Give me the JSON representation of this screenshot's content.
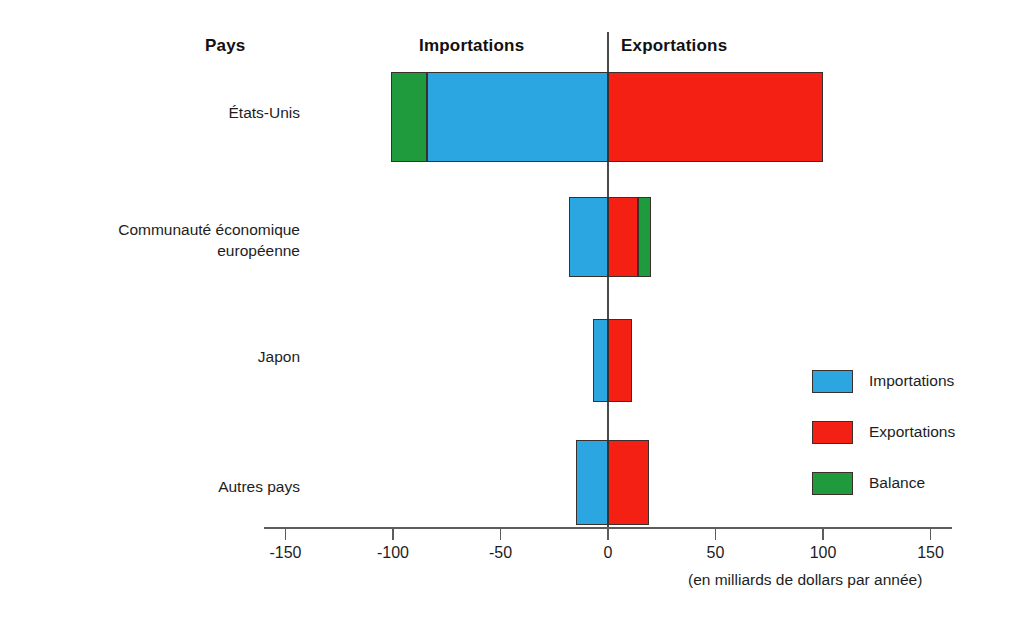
{
  "headers": {
    "category_col": "Pays",
    "left_side": "Importations",
    "right_side": "Exportations"
  },
  "legend": {
    "position": "right-middle",
    "items": [
      {
        "label": "Importations",
        "color": "#2ba6e0",
        "key": "imports"
      },
      {
        "label": "Exportations",
        "color": "#f32013",
        "key": "exports"
      },
      {
        "label": "Balance",
        "color": "#1f9a3c",
        "key": "balance"
      }
    ]
  },
  "axis": {
    "caption": "(en milliards de dollars par année)",
    "ticks": [
      -150,
      -100,
      -50,
      0,
      50,
      100,
      150
    ],
    "tick_labels": [
      "-150",
      "-100",
      "-50",
      "0",
      "50",
      "100",
      "150"
    ],
    "range": [
      -175,
      175
    ],
    "grid": false
  },
  "chart_data": {
    "type": "bar",
    "title": "",
    "subtitle": "",
    "orientation": "horizontal",
    "stacked": true,
    "xlabel": "(en milliards de dollars par année)",
    "ylabel": "Pays",
    "xlim": [
      -175,
      175
    ],
    "grid": false,
    "legend_position": "right",
    "categories": [
      "États-Unis",
      "Communauté économique\neuropéenne",
      "Japon",
      "Autres pays"
    ],
    "series": [
      {
        "name": "Importations",
        "color": "#2ba6e0",
        "values": [
          -84,
          -18,
          -7,
          -15
        ]
      },
      {
        "name": "Exportations",
        "color": "#f32013",
        "values": [
          100,
          14,
          11,
          19
        ]
      },
      {
        "name": "Balance",
        "color": "#1f9a3c",
        "values": [
          -17,
          7,
          0,
          0
        ]
      }
    ]
  },
  "bars": [
    {
      "category": "États-Unis",
      "label_lines": "États-Unis",
      "segments": [
        {
          "key": "balance",
          "from": -101,
          "to": -84
        },
        {
          "key": "imports",
          "from": -84,
          "to": 0
        },
        {
          "key": "exports",
          "from": 0,
          "to": 100
        }
      ]
    },
    {
      "category": "Communauté économique européenne",
      "label_lines": "Communauté économique\neuropéenne",
      "segments": [
        {
          "key": "imports",
          "from": -18,
          "to": 0
        },
        {
          "key": "exports",
          "from": 0,
          "to": 14
        },
        {
          "key": "balance",
          "from": 14,
          "to": 20
        }
      ]
    },
    {
      "category": "Japon",
      "label_lines": "Japon",
      "segments": [
        {
          "key": "imports",
          "from": -7,
          "to": 0
        },
        {
          "key": "exports",
          "from": 0,
          "to": 11
        }
      ]
    },
    {
      "category": "Autres pays",
      "label_lines": "Autres pays",
      "segments": [
        {
          "key": "imports",
          "from": -15,
          "to": 0
        },
        {
          "key": "exports",
          "from": 0,
          "to": 19
        }
      ]
    }
  ]
}
